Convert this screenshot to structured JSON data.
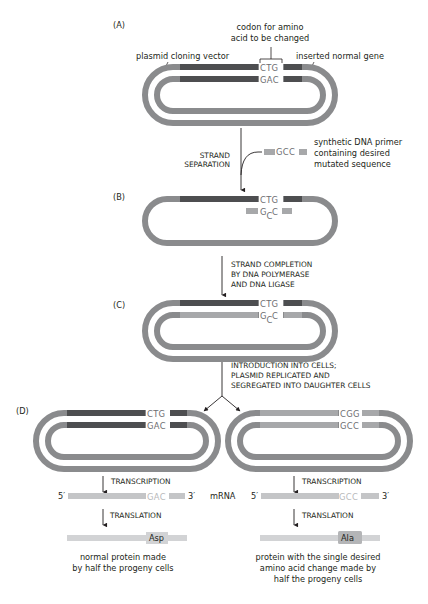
{
  "colors": {
    "vector": "#8a8b8d",
    "normal_gene": "#4d4e50",
    "mutant_gene": "#a7a8aa",
    "mrna": "#c4c5c7",
    "protein": "#d2d3d5",
    "ala_highlight": "#b4b5b7",
    "text": "#231f20"
  },
  "panels": {
    "A": {
      "label": "(A)",
      "codon_label_line1": "codon for amino",
      "codon_label_line2": "acid to be changed",
      "vector_label": "plasmid cloning vector",
      "gene_label": "inserted normal gene",
      "top_seq": "CTG",
      "bottom_seq": "GAC"
    },
    "step_separation": {
      "line1": "STRAND",
      "line2": "SEPARATION"
    },
    "primer": {
      "seq": "GCC",
      "label_line1": "synthetic DNA primer",
      "label_line2": "containing desired",
      "label_line3": "mutated sequence"
    },
    "B": {
      "label": "(B)",
      "top_seq": "CTG",
      "primer_seq_g": "G",
      "primer_seq_c_low": "C",
      "primer_seq_c": "C"
    },
    "step_completion": {
      "line1": "STRAND COMPLETION",
      "line2": "BY DNA POLYMERASE",
      "line3": "AND DNA LIGASE"
    },
    "C": {
      "label": "(C)",
      "top_seq": "CTG",
      "bottom_g": "G",
      "bottom_c_low": "C",
      "bottom_c": "C"
    },
    "step_introduction": {
      "line1": "INTRODUCTION INTO CELLS;",
      "line2": "PLASMID REPLICATED AND",
      "line3": "SEGREGATED INTO DAUGHTER CELLS"
    },
    "D": {
      "label": "(D)",
      "left": {
        "top_seq": "CTG",
        "bottom_seq": "GAC",
        "transcription": "TRANSCRIPTION",
        "mrna_5": "5′",
        "mrna_seq": "GAC",
        "mrna_3": "3′",
        "translation": "TRANSLATION",
        "amino_acid": "Asp",
        "caption_line1": "normal protein made",
        "caption_line2": "by half the progeny cells"
      },
      "mrna_label": "mRNA",
      "right": {
        "top_seq": "CGG",
        "bottom_seq": "GCC",
        "transcription": "TRANSCRIPTION",
        "mrna_5": "5′",
        "mrna_seq": "GCC",
        "mrna_3": "3′",
        "translation": "TRANSLATION",
        "amino_acid": "Ala",
        "caption_line1": "protein with the single desired",
        "caption_line2": "amino acid change made by",
        "caption_line3": "half the progeny cells"
      }
    }
  }
}
